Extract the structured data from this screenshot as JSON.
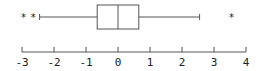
{
  "chart_data": {
    "type": "boxplot",
    "title": "",
    "xlabel": "",
    "ylabel": "",
    "orientation": "horizontal",
    "xlim": [
      -3,
      4
    ],
    "ticks": [
      -3,
      -2,
      -1,
      0,
      1,
      2,
      3,
      4
    ],
    "tick_labels": [
      "-3",
      "-2",
      "-1",
      "0",
      "1",
      "2",
      "3",
      "4"
    ],
    "grid": false,
    "box": {
      "whisker_low": -2.45,
      "q1": -0.65,
      "median": 0.0,
      "q3": 0.65,
      "whisker_high": 2.55
    },
    "outliers": [
      -2.95,
      -2.65,
      3.55
    ],
    "outlier_marker": "*",
    "colors": {
      "line": "#555555",
      "text": "#222222",
      "background": "#ffffff"
    }
  },
  "layout": {
    "origin_px": 118,
    "px_per_unit": 32,
    "box_top": 5,
    "box_bottom": 29,
    "axis_y": 52,
    "tick_len": 5,
    "label_y": 66
  }
}
